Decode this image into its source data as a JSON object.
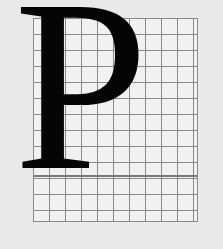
{
  "figure": {
    "glyph": "P",
    "grid": {
      "columns": 10,
      "rows": 13,
      "line_color": "#8a8a8a",
      "fill_color": "#f1f1f1"
    },
    "colors": {
      "background": "#e9e9e9",
      "glyph": "#050505"
    }
  }
}
